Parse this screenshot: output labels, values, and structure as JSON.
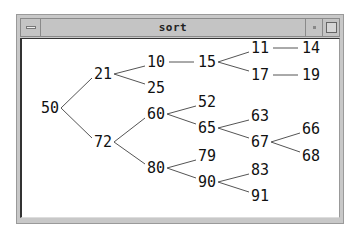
{
  "window": {
    "title": "sort",
    "buttons": [
      "window-menu",
      "minimize",
      "maximize"
    ]
  },
  "tree": {
    "nodes": [
      {
        "id": "50",
        "label": "50",
        "x": 50,
        "y": 108
      },
      {
        "id": "21",
        "label": "21",
        "x": 103,
        "y": 74
      },
      {
        "id": "10",
        "label": "10",
        "x": 156,
        "y": 62
      },
      {
        "id": "25",
        "label": "25",
        "x": 156,
        "y": 88
      },
      {
        "id": "15",
        "label": "15",
        "x": 207,
        "y": 62
      },
      {
        "id": "11",
        "label": "11",
        "x": 260,
        "y": 48
      },
      {
        "id": "14",
        "label": "14",
        "x": 311,
        "y": 48
      },
      {
        "id": "17",
        "label": "17",
        "x": 260,
        "y": 75
      },
      {
        "id": "19",
        "label": "19",
        "x": 311,
        "y": 75
      },
      {
        "id": "72",
        "label": "72",
        "x": 103,
        "y": 142
      },
      {
        "id": "60",
        "label": "60",
        "x": 156,
        "y": 114
      },
      {
        "id": "52",
        "label": "52",
        "x": 207,
        "y": 102
      },
      {
        "id": "65",
        "label": "65",
        "x": 207,
        "y": 128
      },
      {
        "id": "63",
        "label": "63",
        "x": 260,
        "y": 116
      },
      {
        "id": "67",
        "label": "67",
        "x": 260,
        "y": 142
      },
      {
        "id": "66",
        "label": "66",
        "x": 311,
        "y": 129
      },
      {
        "id": "68",
        "label": "68",
        "x": 311,
        "y": 156
      },
      {
        "id": "80",
        "label": "80",
        "x": 156,
        "y": 168
      },
      {
        "id": "79",
        "label": "79",
        "x": 207,
        "y": 156
      },
      {
        "id": "90",
        "label": "90",
        "x": 207,
        "y": 182
      },
      {
        "id": "83",
        "label": "83",
        "x": 260,
        "y": 170
      },
      {
        "id": "91",
        "label": "91",
        "x": 260,
        "y": 196
      }
    ],
    "edges": [
      [
        "50",
        "21"
      ],
      [
        "50",
        "72"
      ],
      [
        "21",
        "10"
      ],
      [
        "21",
        "25"
      ],
      [
        "10",
        "15"
      ],
      [
        "15",
        "11"
      ],
      [
        "15",
        "17"
      ],
      [
        "11",
        "14"
      ],
      [
        "17",
        "19"
      ],
      [
        "72",
        "60"
      ],
      [
        "72",
        "80"
      ],
      [
        "60",
        "52"
      ],
      [
        "60",
        "65"
      ],
      [
        "65",
        "63"
      ],
      [
        "65",
        "67"
      ],
      [
        "67",
        "66"
      ],
      [
        "67",
        "68"
      ],
      [
        "80",
        "79"
      ],
      [
        "80",
        "90"
      ],
      [
        "90",
        "83"
      ],
      [
        "90",
        "91"
      ]
    ]
  }
}
